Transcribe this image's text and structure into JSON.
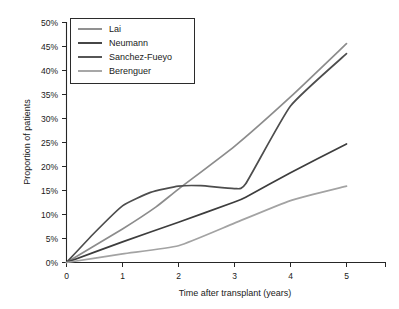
{
  "chart_data": {
    "type": "line",
    "title": "",
    "xlabel": "Time after transplant (years)",
    "ylabel": "Proportion of patients",
    "xlim": [
      0,
      5
    ],
    "ylim": [
      0,
      50
    ],
    "grid": false,
    "legend_position": "top-left",
    "x": [
      0,
      1,
      2,
      3,
      4,
      5
    ],
    "xtick_labels": [
      "0",
      "1",
      "2",
      "3",
      "4",
      "5"
    ],
    "ytick_labels": [
      "0%",
      "5%",
      "10%",
      "15%",
      "20%",
      "25%",
      "30%",
      "35%",
      "40%",
      "45%",
      "50%"
    ],
    "ytick_values": [
      0,
      5,
      10,
      15,
      20,
      25,
      30,
      35,
      40,
      45,
      50
    ],
    "series": [
      {
        "name": "Lai",
        "color": "#8c8c8c",
        "values": [
          0,
          7.0,
          15.3,
          24.2,
          34.5,
          45.6
        ],
        "points": [
          {
            "x": 0,
            "y": 0
          },
          {
            "x": 1,
            "y": 7.0
          },
          {
            "x": 1.6,
            "y": 11.6
          },
          {
            "x": 2,
            "y": 15.3
          },
          {
            "x": 3,
            "y": 24.2
          },
          {
            "x": 4,
            "y": 34.5
          },
          {
            "x": 5,
            "y": 45.6
          }
        ]
      },
      {
        "name": "Neumann",
        "color": "#3d3d3d",
        "values": [
          0,
          4.3,
          8.4,
          12.6,
          18.7,
          24.7
        ],
        "points": [
          {
            "x": 0,
            "y": 0
          },
          {
            "x": 1,
            "y": 4.3
          },
          {
            "x": 2,
            "y": 8.4
          },
          {
            "x": 3,
            "y": 12.6
          },
          {
            "x": 3.2,
            "y": 13.6
          },
          {
            "x": 4,
            "y": 18.7
          },
          {
            "x": 5,
            "y": 24.7
          }
        ]
      },
      {
        "name": "Sanchez-Fueyo",
        "color": "#4d4d4d",
        "values": [
          0,
          11.8,
          15.9,
          15.4,
          32.6,
          43.5
        ],
        "points": [
          {
            "x": 0,
            "y": 0
          },
          {
            "x": 0.5,
            "y": 6.2
          },
          {
            "x": 1,
            "y": 11.8
          },
          {
            "x": 1.5,
            "y": 14.6
          },
          {
            "x": 2,
            "y": 15.9
          },
          {
            "x": 2.4,
            "y": 16.0
          },
          {
            "x": 3,
            "y": 15.4
          },
          {
            "x": 3.2,
            "y": 16.4
          },
          {
            "x": 4,
            "y": 32.6
          },
          {
            "x": 5,
            "y": 43.5
          }
        ]
      },
      {
        "name": "Berenguer",
        "color": "#a3a3a3",
        "values": [
          0,
          1.8,
          3.5,
          8.2,
          12.9,
          15.9
        ],
        "points": [
          {
            "x": 0,
            "y": 0
          },
          {
            "x": 1,
            "y": 1.8
          },
          {
            "x": 2,
            "y": 3.5
          },
          {
            "x": 3,
            "y": 8.2
          },
          {
            "x": 4,
            "y": 12.9
          },
          {
            "x": 5,
            "y": 15.9
          }
        ]
      }
    ]
  },
  "legend": {
    "entries": [
      {
        "label": "Lai"
      },
      {
        "label": "Neumann"
      },
      {
        "label": "Sanchez-Fueyo"
      },
      {
        "label": "Berenguer"
      }
    ]
  },
  "axes": {
    "x_title": "Time after transplant (years)",
    "y_title": "Proportion of patients",
    "x_ticks": [
      "0",
      "1",
      "2",
      "3",
      "4",
      "5"
    ],
    "y_ticks": [
      "50%",
      "45%",
      "40%",
      "35%",
      "30%",
      "25%",
      "20%",
      "15%",
      "10%",
      "5%",
      "0%"
    ]
  }
}
